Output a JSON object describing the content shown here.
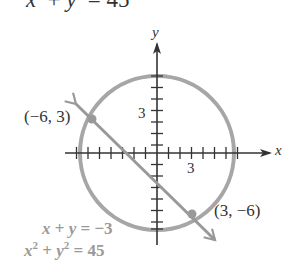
{
  "top_equation": {
    "lhs_x": "x",
    "sup1": "2",
    "plus": " + ",
    "lhs_y": "y",
    "sup2": "2",
    "rhs": " = 45"
  },
  "axes": {
    "x_label": "x",
    "y_label": "y",
    "x_tick_label": "3",
    "y_tick_label": "3",
    "x_range": [
      -7,
      9
    ],
    "y_range": [
      -8,
      9
    ],
    "tick_spacing": 1
  },
  "points": [
    {
      "label": "(−6, 3)",
      "x": -6,
      "y": 3
    },
    {
      "label": "(3, −6)",
      "x": 3,
      "y": -6
    }
  ],
  "curves": {
    "circle": {
      "equation": "x² + y² = 45",
      "radius_squared": 45,
      "color": "#a6a6a6"
    },
    "line": {
      "equation": "x + y = −3",
      "color": "#999999"
    }
  },
  "legend": {
    "line_eq": {
      "x": "x",
      "mid": " + ",
      "y": "y",
      "rhs": " = −3"
    },
    "circle_eq": {
      "x": "x",
      "sup1": "2",
      "mid": " + ",
      "y": "y",
      "sup2": "2",
      "rhs": " = 45"
    }
  },
  "colors": {
    "axis": "#333333",
    "curve": "#a6a6a6",
    "text": "#333333",
    "legend_text": "#9a9a9a"
  }
}
